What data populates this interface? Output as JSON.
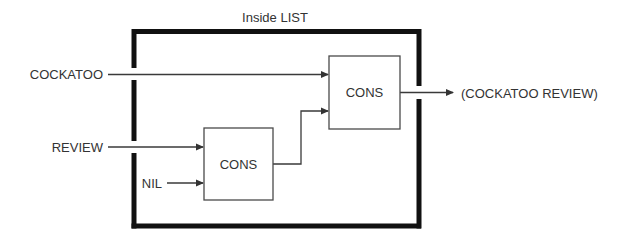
{
  "diagram": {
    "title": "Inside LIST",
    "colors": {
      "border": "#111111",
      "wire": "#3a3a3a",
      "box": "#4a4a4a",
      "text": "#333333",
      "background": "#ffffff"
    },
    "inputs": {
      "first": "COCKATOO",
      "second": "REVIEW",
      "nil": "NIL"
    },
    "boxes": {
      "inner_cons": "CONS",
      "outer_cons": "CONS"
    },
    "output": "(COCKATOO REVIEW)"
  }
}
